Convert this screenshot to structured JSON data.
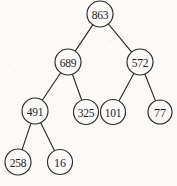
{
  "figure": {
    "type": "binary-tree-diagram",
    "background_color": "#fbfaf8",
    "stroke_color": "#2b2b2b",
    "width": 177,
    "height": 186
  },
  "tree": {
    "nodes": [
      {
        "id": "n0",
        "value": "863",
        "cx": 100,
        "cy": 14,
        "r": 13,
        "level": 0
      },
      {
        "id": "n1",
        "value": "689",
        "cx": 68,
        "cy": 62,
        "r": 13,
        "level": 1
      },
      {
        "id": "n2",
        "value": "572",
        "cx": 140,
        "cy": 62,
        "r": 13,
        "level": 1
      },
      {
        "id": "n3",
        "value": "491",
        "cx": 35,
        "cy": 111,
        "r": 13,
        "level": 2
      },
      {
        "id": "n4",
        "value": "325",
        "cx": 86,
        "cy": 112,
        "r": 12.5,
        "level": 2
      },
      {
        "id": "n5",
        "value": "101",
        "cx": 113,
        "cy": 112,
        "r": 12.5,
        "level": 2
      },
      {
        "id": "n6",
        "value": "77",
        "cx": 160,
        "cy": 112,
        "r": 12,
        "level": 2
      },
      {
        "id": "n7",
        "value": "258",
        "cx": 18,
        "cy": 162,
        "r": 13,
        "level": 3
      },
      {
        "id": "n8",
        "value": "16",
        "cx": 60,
        "cy": 162,
        "r": 12.5,
        "level": 3
      }
    ],
    "edges": [
      {
        "from": "n0",
        "to": "n1"
      },
      {
        "from": "n0",
        "to": "n2"
      },
      {
        "from": "n1",
        "to": "n3"
      },
      {
        "from": "n1",
        "to": "n4"
      },
      {
        "from": "n2",
        "to": "n5"
      },
      {
        "from": "n2",
        "to": "n6"
      },
      {
        "from": "n3",
        "to": "n7"
      },
      {
        "from": "n3",
        "to": "n8"
      }
    ]
  }
}
